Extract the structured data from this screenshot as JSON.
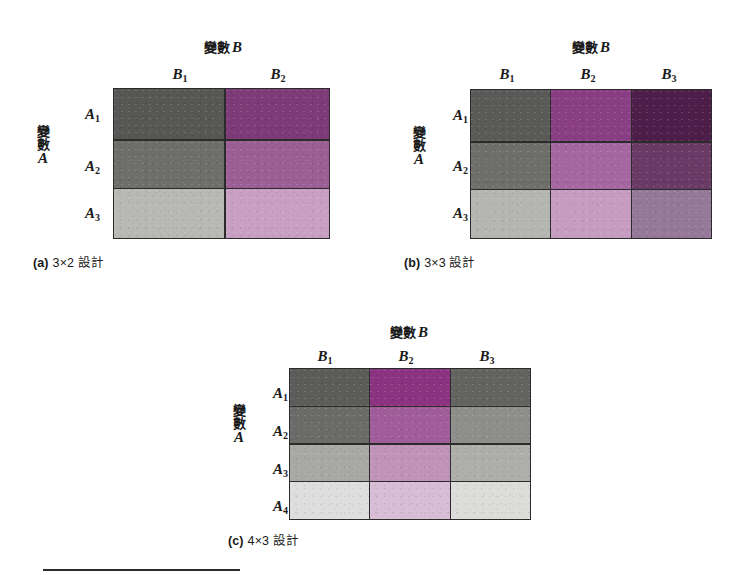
{
  "figure": {
    "col_variable_prefix": "變數",
    "col_variable_name": "B",
    "row_variable_char1": "變",
    "row_variable_char2": "數",
    "row_variable_name": "A"
  },
  "panels": [
    {
      "id": "a",
      "caption_tag": "(a)",
      "caption_text": "3×2 設計",
      "col_var_label": "變數",
      "col_var_name": "B",
      "row_var_char1": "變",
      "row_var_char2": "數",
      "row_var_name": "A",
      "columns": [
        {
          "label": "B",
          "sub": "1"
        },
        {
          "label": "B",
          "sub": "2"
        }
      ],
      "rows": [
        {
          "label": "A",
          "sub": "1"
        },
        {
          "label": "A",
          "sub": "2"
        },
        {
          "label": "A",
          "sub": "3"
        }
      ],
      "cell_colors": [
        [
          "#575755",
          "#7d3b78"
        ],
        [
          "#6e6e6a",
          "#9b5f96"
        ],
        [
          "#b8b8b5",
          "#c9a0c4"
        ]
      ]
    },
    {
      "id": "b",
      "caption_tag": "(b)",
      "caption_text": "3×3 設計",
      "col_var_label": "變數",
      "col_var_name": "B",
      "row_var_char1": "變",
      "row_var_char2": "數",
      "row_var_name": "A",
      "columns": [
        {
          "label": "B",
          "sub": "1"
        },
        {
          "label": "B",
          "sub": "2"
        },
        {
          "label": "B",
          "sub": "3"
        }
      ],
      "rows": [
        {
          "label": "A",
          "sub": "1"
        },
        {
          "label": "A",
          "sub": "2"
        },
        {
          "label": "A",
          "sub": "3"
        }
      ],
      "cell_colors": [
        [
          "#5a5a58",
          "#8a3f85",
          "#4e1e4a"
        ],
        [
          "#6e6e6b",
          "#a467a0",
          "#6a3a66"
        ],
        [
          "#b5b5b2",
          "#c79cc2",
          "#96789a"
        ]
      ]
    },
    {
      "id": "c",
      "caption_tag": "(c)",
      "caption_text": "4×3 設計",
      "col_var_label": "變數",
      "col_var_name": "B",
      "row_var_char1": "變",
      "row_var_char2": "數",
      "row_var_name": "A",
      "columns": [
        {
          "label": "B",
          "sub": "1"
        },
        {
          "label": "B",
          "sub": "2"
        },
        {
          "label": "B",
          "sub": "3"
        }
      ],
      "rows": [
        {
          "label": "A",
          "sub": "1"
        },
        {
          "label": "A",
          "sub": "2"
        },
        {
          "label": "A",
          "sub": "3"
        },
        {
          "label": "A",
          "sub": "4"
        }
      ],
      "cell_colors": [
        [
          "#5c5c5a",
          "#8b3380",
          "#636361"
        ],
        [
          "#6b6b69",
          "#a05d9a",
          "#8e8e8c"
        ],
        [
          "#a8a8a5",
          "#c093bb",
          "#aeaeab"
        ],
        [
          "#dedede",
          "#d9bcd6",
          "#dcdcda"
        ]
      ]
    }
  ],
  "colors": {
    "ink": "#1a1a1a",
    "rule": "#2b2b2b",
    "page": "#ffffff"
  }
}
